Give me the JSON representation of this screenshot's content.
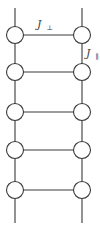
{
  "diagram": {
    "labels": {
      "rung_coupling": {
        "symbol": "J",
        "subscript": "⊥"
      },
      "leg_coupling": {
        "symbol": "J",
        "subscript": "∥"
      }
    },
    "structure": {
      "legs": 2,
      "rungs": 5,
      "sites": 10
    },
    "colors": {
      "stroke": "#3a3a3a",
      "background": "#ffffff",
      "node_fill": "#ffffff"
    }
  }
}
